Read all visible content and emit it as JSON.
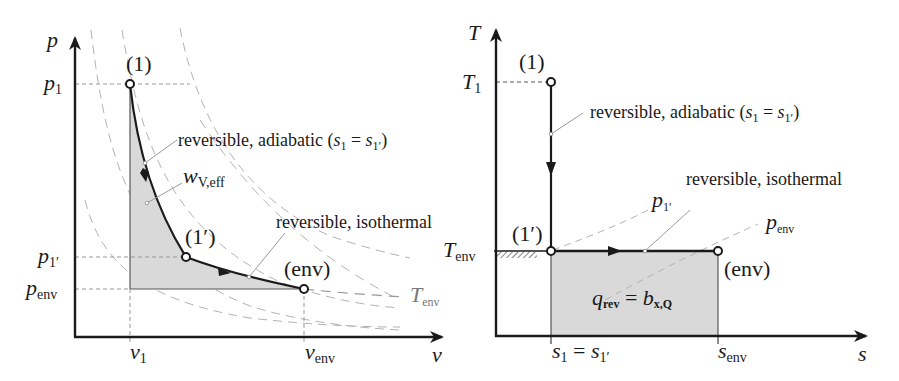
{
  "figure": {
    "left_panel": {
      "name": "p-v diagram",
      "axes": {
        "y_label": "p",
        "x_label": "v",
        "y_ticks": [
          {
            "main": "p",
            "sub": "1"
          },
          {
            "main": "p",
            "sub": "1′"
          },
          {
            "main": "p",
            "sub": "env"
          }
        ],
        "x_ticks": [
          {
            "main": "v",
            "sub": "1"
          },
          {
            "main": "v",
            "sub": "env"
          }
        ]
      },
      "states": [
        {
          "label": "(1)"
        },
        {
          "label": "(1′)"
        },
        {
          "label": "(env)"
        }
      ],
      "annotations": {
        "adiabatic": "reversible, adiabatic (",
        "adiabatic_math_a": "s",
        "adiabatic_sub_a": "1",
        "adiabatic_eq": " = ",
        "adiabatic_math_b": "s",
        "adiabatic_sub_b": "1′",
        "adiabatic_close": ")",
        "work_main": "w",
        "work_sub": "V,eff",
        "isothermal": "reversible, isothermal",
        "isotherm_main": "T",
        "isotherm_sub": "env"
      }
    },
    "right_panel": {
      "name": "T-s diagram",
      "axes": {
        "y_label": "T",
        "x_label": "s",
        "y_ticks": [
          {
            "main": "T",
            "sub": "1"
          },
          {
            "main": "T",
            "sub": "env"
          }
        ],
        "x_ticks": [
          {
            "main": "s",
            "sub": "1",
            "eq": " = ",
            "main2": "s",
            "sub2": "1′"
          },
          {
            "main": "s",
            "sub": "env"
          }
        ]
      },
      "states": [
        {
          "label": "(1)"
        },
        {
          "label": "(1′)"
        },
        {
          "label": "(env)"
        }
      ],
      "annotations": {
        "adiabatic": "reversible, adiabatic (",
        "adiabatic_math_a": "s",
        "adiabatic_sub_a": "1",
        "adiabatic_eq": " = ",
        "adiabatic_math_b": "s",
        "adiabatic_sub_b": "1′",
        "adiabatic_close": ")",
        "isothermal": "reversible, isothermal",
        "isobar_1": {
          "main": "p",
          "sub": "1′"
        },
        "isobar_env": {
          "main": "p",
          "sub": "env"
        },
        "area_main": "q",
        "area_sub": "rev",
        "area_eq": " = ",
        "area_main2": "b",
        "area_sub2": "x,Q"
      }
    },
    "colors": {
      "line": "#1a1a1a",
      "fill": "#d9d9d9",
      "dashed": "#aaaaaa",
      "leader": "#9a9a9a"
    }
  }
}
